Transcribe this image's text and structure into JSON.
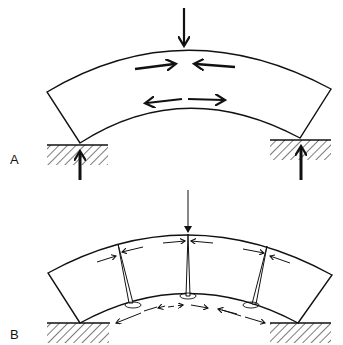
{
  "figure": {
    "panels": [
      {
        "id": "A",
        "label": "A",
        "state": "intact",
        "features": [
          "central downward load",
          "compression arrows at top",
          "tension arrows at bottom",
          "two hatched supports with upward reactions"
        ]
      },
      {
        "id": "B",
        "label": "B",
        "state": "cracked",
        "features": [
          "central downward load",
          "three radial cracks from bottom surface",
          "paired compression arrows at crack tops",
          "dashed tension arrows below"
        ]
      }
    ],
    "colors": {
      "ink": "#111111",
      "background": "#ffffff"
    }
  }
}
